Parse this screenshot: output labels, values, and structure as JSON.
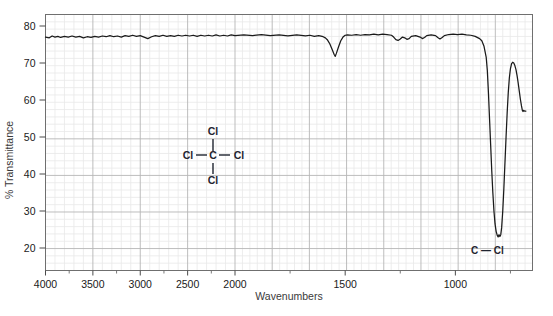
{
  "chart_data": {
    "type": "line",
    "title": "",
    "xlabel": "Wavenumbers",
    "ylabel": "% Transmittance",
    "xlim": [
      4000,
      650
    ],
    "ylim": [
      13,
      84
    ],
    "x_tick_labels": [
      "4000",
      "3500",
      "3000",
      "2500",
      "2000",
      "1500",
      "1000"
    ],
    "x_ticks": [
      4000,
      3500,
      3000,
      2500,
      2000,
      1500,
      1000
    ],
    "y_tick_labels": [
      "80",
      "70",
      "60",
      "50",
      "40",
      "30",
      "20"
    ],
    "y_ticks": [
      80,
      70,
      60,
      50,
      40,
      30,
      20
    ],
    "x_axis_scale_note": "piecewise: 4000-2000 compressed, 2000-650 expanded",
    "grid": "minor and major grid on",
    "legend": "none",
    "series": [
      {
        "name": "CCl4 IR transmittance",
        "points": [
          [
            4000,
            77.0
          ],
          [
            3960,
            76.8
          ],
          [
            3930,
            77.3
          ],
          [
            3900,
            77.0
          ],
          [
            3870,
            77.2
          ],
          [
            3840,
            76.9
          ],
          [
            3800,
            77.2
          ],
          [
            3760,
            77.0
          ],
          [
            3720,
            77.3
          ],
          [
            3680,
            77.0
          ],
          [
            3640,
            77.2
          ],
          [
            3600,
            76.8
          ],
          [
            3560,
            77.1
          ],
          [
            3520,
            76.9
          ],
          [
            3480,
            77.2
          ],
          [
            3440,
            77.0
          ],
          [
            3400,
            77.3
          ],
          [
            3360,
            77.1
          ],
          [
            3320,
            77.4
          ],
          [
            3280,
            77.1
          ],
          [
            3240,
            77.3
          ],
          [
            3200,
            77.0
          ],
          [
            3160,
            77.4
          ],
          [
            3120,
            77.2
          ],
          [
            3080,
            77.5
          ],
          [
            3040,
            77.2
          ],
          [
            3000,
            77.4
          ],
          [
            2960,
            77.0
          ],
          [
            2920,
            76.6
          ],
          [
            2880,
            77.1
          ],
          [
            2840,
            77.4
          ],
          [
            2800,
            77.2
          ],
          [
            2760,
            77.5
          ],
          [
            2720,
            77.2
          ],
          [
            2680,
            77.4
          ],
          [
            2640,
            77.2
          ],
          [
            2600,
            77.5
          ],
          [
            2560,
            77.3
          ],
          [
            2520,
            77.5
          ],
          [
            2480,
            77.3
          ],
          [
            2440,
            77.5
          ],
          [
            2400,
            77.2
          ],
          [
            2360,
            77.5
          ],
          [
            2320,
            77.3
          ],
          [
            2280,
            77.5
          ],
          [
            2240,
            77.3
          ],
          [
            2200,
            77.6
          ],
          [
            2160,
            77.3
          ],
          [
            2120,
            77.5
          ],
          [
            2080,
            77.3
          ],
          [
            2040,
            77.6
          ],
          [
            2000,
            77.4
          ],
          [
            1960,
            77.6
          ],
          [
            1920,
            77.4
          ],
          [
            1880,
            77.7
          ],
          [
            1840,
            77.4
          ],
          [
            1800,
            77.6
          ],
          [
            1760,
            77.3
          ],
          [
            1720,
            77.6
          ],
          [
            1680,
            77.3
          ],
          [
            1660,
            77.5
          ],
          [
            1640,
            77.2
          ],
          [
            1620,
            77.4
          ],
          [
            1600,
            77.1
          ],
          [
            1590,
            76.8
          ],
          [
            1580,
            76.2
          ],
          [
            1570,
            75.2
          ],
          [
            1560,
            73.8
          ],
          [
            1550,
            72.3
          ],
          [
            1545,
            71.8
          ],
          [
            1540,
            72.6
          ],
          [
            1530,
            74.4
          ],
          [
            1520,
            76.0
          ],
          [
            1510,
            77.0
          ],
          [
            1500,
            77.5
          ],
          [
            1490,
            77.6
          ],
          [
            1470,
            77.5
          ],
          [
            1450,
            77.7
          ],
          [
            1430,
            77.5
          ],
          [
            1410,
            77.7
          ],
          [
            1390,
            77.6
          ],
          [
            1370,
            77.8
          ],
          [
            1350,
            77.6
          ],
          [
            1330,
            77.8
          ],
          [
            1310,
            77.7
          ],
          [
            1290,
            77.5
          ],
          [
            1280,
            77.0
          ],
          [
            1270,
            76.3
          ],
          [
            1260,
            76.1
          ],
          [
            1250,
            76.5
          ],
          [
            1240,
            77.0
          ],
          [
            1230,
            76.8
          ],
          [
            1220,
            76.4
          ],
          [
            1210,
            76.6
          ],
          [
            1200,
            77.2
          ],
          [
            1180,
            77.4
          ],
          [
            1160,
            77.0
          ],
          [
            1150,
            76.6
          ],
          [
            1140,
            76.9
          ],
          [
            1130,
            77.4
          ],
          [
            1110,
            77.6
          ],
          [
            1090,
            77.4
          ],
          [
            1080,
            76.9
          ],
          [
            1070,
            76.5
          ],
          [
            1060,
            76.9
          ],
          [
            1050,
            77.4
          ],
          [
            1030,
            77.7
          ],
          [
            1010,
            77.8
          ],
          [
            990,
            77.7
          ],
          [
            970,
            77.8
          ],
          [
            950,
            77.6
          ],
          [
            930,
            77.5
          ],
          [
            910,
            77.2
          ],
          [
            890,
            76.6
          ],
          [
            880,
            76.0
          ],
          [
            870,
            74.5
          ],
          [
            860,
            71.5
          ],
          [
            855,
            68.0
          ],
          [
            850,
            62.0
          ],
          [
            845,
            55.0
          ],
          [
            840,
            48.0
          ],
          [
            835,
            41.0
          ],
          [
            830,
            35.0
          ],
          [
            825,
            30.0
          ],
          [
            820,
            26.5
          ],
          [
            815,
            24.5
          ],
          [
            810,
            23.4
          ],
          [
            806,
            23.0
          ],
          [
            802,
            23.6
          ],
          [
            798,
            23.1
          ],
          [
            794,
            23.6
          ],
          [
            790,
            25.5
          ],
          [
            785,
            30.0
          ],
          [
            780,
            36.0
          ],
          [
            775,
            43.0
          ],
          [
            770,
            50.0
          ],
          [
            765,
            56.5
          ],
          [
            760,
            62.0
          ],
          [
            755,
            66.0
          ],
          [
            750,
            68.5
          ],
          [
            745,
            69.8
          ],
          [
            740,
            70.2
          ],
          [
            735,
            70.0
          ],
          [
            730,
            69.3
          ],
          [
            725,
            68.2
          ],
          [
            720,
            66.6
          ],
          [
            715,
            64.6
          ],
          [
            710,
            62.4
          ],
          [
            705,
            60.2
          ],
          [
            700,
            58.4
          ],
          [
            696,
            57.2
          ],
          [
            693,
            56.9
          ],
          [
            690,
            57.2
          ],
          [
            686,
            57.0
          ],
          [
            680,
            57.0
          ]
        ]
      }
    ],
    "annotations": [
      {
        "text": "C — Cl",
        "x": 800,
        "y": 23,
        "label": "c-cl-peak-label"
      }
    ],
    "structure": {
      "name": "carbon-tetrachloride",
      "center": "C",
      "top": "Cl",
      "left": "Cl",
      "right": "Cl",
      "bottom": "Cl"
    }
  },
  "colors": {
    "trace": "#1a1a1a",
    "grid_minor": "#e9e9e9",
    "grid_major": "#b6b6b6",
    "border": "#6f6f6f",
    "text": "#1a1a1a",
    "axis_title": "#3a3a3a",
    "background": "#ffffff"
  }
}
